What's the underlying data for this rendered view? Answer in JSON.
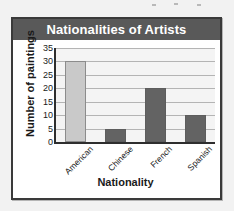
{
  "figure": {
    "title": "Nationalities of Artists"
  },
  "chart_data": {
    "type": "bar",
    "title": "Nationalities of Artists",
    "categories": [
      "American",
      "Chinese",
      "French",
      "Spanish"
    ],
    "values": [
      30,
      5,
      20,
      10
    ],
    "xlabel": "Nationality",
    "ylabel": "Number of paintings",
    "ylim": [
      0,
      35
    ],
    "ytick_labels": [
      "0",
      "5",
      "10",
      "15",
      "20",
      "25",
      "30",
      "35"
    ],
    "ytick_values": [
      0,
      5,
      10,
      15,
      20,
      25,
      30,
      35
    ],
    "grid": true,
    "legend": "none",
    "bar_colors": [
      "#c9c9c9",
      "#636363",
      "#636363",
      "#636363"
    ],
    "colors": {
      "title_bar": "#595959",
      "title_text": "#ffffff",
      "plot_background": "#f4f4f4",
      "gridline": "#b4b4b4",
      "axis": "#2e2e2e",
      "frame": "#3a3a3a",
      "page_background": "#f2f2f2",
      "bar_light": "#c9c9c9",
      "bar_dark": "#636363"
    }
  }
}
